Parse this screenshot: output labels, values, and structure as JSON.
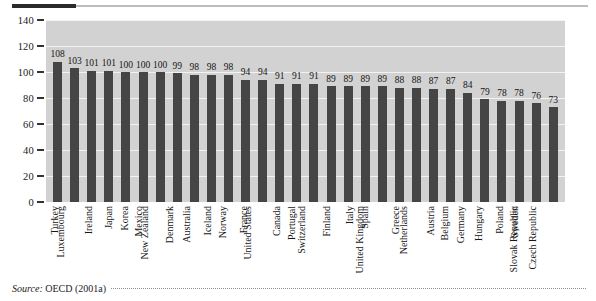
{
  "figure": {
    "source_label": "Source:",
    "source_note": "OECD (2001a)"
  },
  "chart_data": {
    "type": "bar",
    "title": "",
    "xlabel": "",
    "ylabel": "",
    "ylim": [
      0,
      140
    ],
    "yticks": [
      0,
      20,
      40,
      60,
      80,
      100,
      120,
      140
    ],
    "grid": true,
    "legend": "none",
    "bar_color": "#454545",
    "plot_background": "#d2d2d2",
    "gridline_color": "#f2f2f2",
    "categories": [
      "Turkey",
      "Luxembourg",
      "Ireland",
      "Japan",
      "Korea",
      "Mexico",
      "New Zealand",
      "Denmark",
      "Australia",
      "Iceland",
      "Norway",
      "France",
      "United States",
      "Canada",
      "Portugal",
      "Switzerland",
      "Finland",
      "Italy",
      "Spain",
      "United Kingdom",
      "Greece",
      "Netherlands",
      "Austria",
      "Belgium",
      "Germany",
      "Hungary",
      "Poland",
      "Sweden",
      "Slovak Republic",
      "Czech Republic"
    ],
    "values": [
      108,
      103,
      101,
      101,
      100,
      100,
      100,
      99,
      98,
      98,
      98,
      94,
      94,
      91,
      91,
      91,
      89,
      89,
      89,
      89,
      88,
      88,
      87,
      87,
      84,
      79,
      78,
      78,
      76,
      73
    ]
  }
}
